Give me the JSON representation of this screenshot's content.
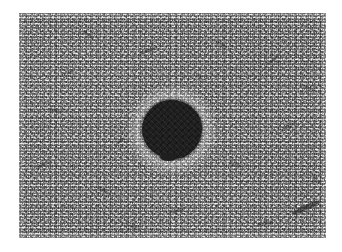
{
  "figure": {
    "kind": "grayscale-micrograph",
    "caption": "",
    "canvas": {
      "width": 342,
      "height": 252,
      "background": "#ffffff"
    },
    "plate": {
      "left": 19,
      "top": 13,
      "width": 307,
      "height": 225,
      "matrix_tone": "#a6a6a6",
      "description": "fine-grained speckled matrix"
    },
    "inclusion": {
      "label": "",
      "shape": "irregular-circle",
      "center_x": 172,
      "center_y": 130,
      "diameter": 60,
      "color": "#1f1f20",
      "halo": true
    },
    "streaks": [
      {
        "left": 272,
        "top": 192,
        "width": 30,
        "height": 5,
        "angle": -24,
        "opacity": 0.8
      },
      {
        "left": 238,
        "top": 209,
        "width": 16,
        "height": 3,
        "angle": -12,
        "opacity": 0.55
      },
      {
        "left": 62,
        "top": 20,
        "width": 14,
        "height": 3,
        "angle": 28,
        "opacity": 0.5
      },
      {
        "left": 120,
        "top": 36,
        "width": 18,
        "height": 3,
        "angle": -18,
        "opacity": 0.55
      },
      {
        "left": 196,
        "top": 30,
        "width": 12,
        "height": 3,
        "angle": 40,
        "opacity": 0.45
      },
      {
        "left": 246,
        "top": 46,
        "width": 15,
        "height": 3,
        "angle": -34,
        "opacity": 0.5
      },
      {
        "left": 30,
        "top": 96,
        "width": 13,
        "height": 3,
        "angle": 16,
        "opacity": 0.45
      },
      {
        "left": 16,
        "top": 150,
        "width": 17,
        "height": 3,
        "angle": -26,
        "opacity": 0.5
      },
      {
        "left": 78,
        "top": 176,
        "width": 14,
        "height": 3,
        "angle": 34,
        "opacity": 0.45
      },
      {
        "left": 150,
        "top": 196,
        "width": 16,
        "height": 3,
        "angle": -14,
        "opacity": 0.5
      },
      {
        "left": 210,
        "top": 150,
        "width": 12,
        "height": 3,
        "angle": 22,
        "opacity": 0.42
      },
      {
        "left": 262,
        "top": 112,
        "width": 15,
        "height": 3,
        "angle": -30,
        "opacity": 0.48
      },
      {
        "left": 284,
        "top": 74,
        "width": 12,
        "height": 3,
        "angle": 18,
        "opacity": 0.42
      },
      {
        "left": 96,
        "top": 126,
        "width": 11,
        "height": 3,
        "angle": -40,
        "opacity": 0.4
      },
      {
        "left": 44,
        "top": 58,
        "width": 12,
        "height": 3,
        "angle": -8,
        "opacity": 0.42
      },
      {
        "left": 176,
        "top": 64,
        "width": 10,
        "height": 3,
        "angle": 50,
        "opacity": 0.38
      },
      {
        "left": 108,
        "top": 212,
        "width": 13,
        "height": 3,
        "angle": 10,
        "opacity": 0.44
      },
      {
        "left": 292,
        "top": 166,
        "width": 11,
        "height": 3,
        "angle": 36,
        "opacity": 0.4
      }
    ]
  }
}
